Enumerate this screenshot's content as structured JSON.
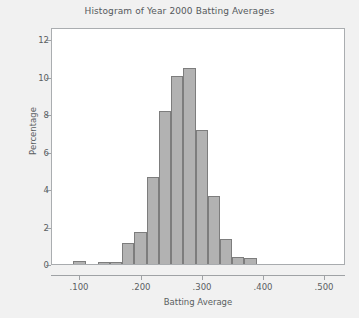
{
  "chart_data": {
    "type": "bar",
    "title": "Histogram of Year 2000 Batting Averages",
    "xlabel": "Batting Average",
    "ylabel": "Percentage",
    "xlim": [
      0.055,
      0.533
    ],
    "ylim": [
      0,
      12.6
    ],
    "bin_width": 0.02,
    "grid": false,
    "legend": null,
    "xticks": [
      ".100",
      ".200",
      ".300",
      ".400",
      ".500"
    ],
    "xtick_values": [
      0.1,
      0.2,
      0.3,
      0.4,
      0.5
    ],
    "yticks": [
      "0",
      "2",
      "4",
      "6",
      "8",
      "10",
      "12"
    ],
    "ytick_values": [
      0,
      2,
      4,
      6,
      8,
      10,
      12
    ],
    "bars": [
      {
        "x0": 0.09,
        "x1": 0.11,
        "value": 0.2
      },
      {
        "x0": 0.13,
        "x1": 0.15,
        "value": 0.15
      },
      {
        "x0": 0.15,
        "x1": 0.17,
        "value": 0.15
      },
      {
        "x0": 0.17,
        "x1": 0.19,
        "value": 1.2
      },
      {
        "x0": 0.19,
        "x1": 0.21,
        "value": 1.75
      },
      {
        "x0": 0.21,
        "x1": 0.23,
        "value": 4.7
      },
      {
        "x0": 0.23,
        "x1": 0.25,
        "value": 8.2
      },
      {
        "x0": 0.25,
        "x1": 0.27,
        "value": 10.1
      },
      {
        "x0": 0.27,
        "x1": 0.29,
        "value": 10.5
      },
      {
        "x0": 0.29,
        "x1": 0.31,
        "value": 7.2
      },
      {
        "x0": 0.31,
        "x1": 0.33,
        "value": 3.7
      },
      {
        "x0": 0.33,
        "x1": 0.35,
        "value": 1.4
      },
      {
        "x0": 0.35,
        "x1": 0.37,
        "value": 0.45
      },
      {
        "x0": 0.37,
        "x1": 0.39,
        "value": 0.35
      }
    ],
    "categories": [
      "0.090-0.110",
      "0.130-0.150",
      "0.150-0.170",
      "0.170-0.190",
      "0.190-0.210",
      "0.210-0.230",
      "0.230-0.250",
      "0.250-0.270",
      "0.270-0.290",
      "0.290-0.310",
      "0.310-0.330",
      "0.330-0.350",
      "0.350-0.370",
      "0.370-0.390"
    ],
    "values": [
      0.2,
      0.15,
      0.15,
      1.2,
      1.75,
      4.7,
      8.2,
      10.1,
      10.5,
      7.2,
      3.7,
      1.4,
      0.45,
      0.35
    ]
  },
  "colors": {
    "bar_fill": "#b2b2b2",
    "bar_border": "#7d7d7d",
    "axis": "#9fa2a5",
    "text": "#5a5e61",
    "plot_background": "#ffffff",
    "page_background": "#f1f1f1"
  }
}
